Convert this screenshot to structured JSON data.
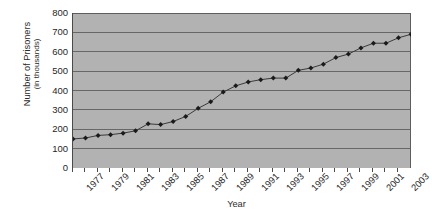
{
  "chart_data": {
    "type": "line",
    "title": "",
    "xlabel": "Year",
    "ylabel": "Number of Prisoners (in thousands)",
    "ylabel_line1": "Number of Prisoners",
    "ylabel_line2": "(in thousands)",
    "ylim": [
      0,
      800
    ],
    "ytick_step": 100,
    "yticks": [
      800,
      700,
      600,
      500,
      400,
      300,
      200,
      100,
      0
    ],
    "ytick_labels": [
      "800",
      "700",
      "600",
      "500",
      "400",
      "300",
      "200",
      "100",
      "0"
    ],
    "grid": "horizontal",
    "legend": "none",
    "marker": "diamond",
    "marker_color": "#1a1a1a",
    "line_color": "#3a3a3a",
    "plot_background": "#b2b2b2",
    "gridline_color": "#5e5e5e",
    "page_background": "#ffffff",
    "xlim": [
      1977,
      2004
    ],
    "xtick_labels": [
      "1977",
      "1979",
      "1981",
      "1983",
      "1985",
      "1987",
      "1989",
      "1991",
      "1993",
      "1995",
      "1997",
      "1999",
      "2001",
      "2003"
    ],
    "x": [
      1977,
      1978,
      1979,
      1980,
      1981,
      1982,
      1983,
      1984,
      1985,
      1986,
      1987,
      1988,
      1989,
      1990,
      1991,
      1992,
      1993,
      1994,
      1995,
      1996,
      1997,
      1998,
      1999,
      2000,
      2001,
      2002,
      2003,
      2004
    ],
    "values": [
      150,
      155,
      168,
      172,
      180,
      192,
      228,
      224,
      240,
      266,
      308,
      342,
      392,
      424,
      444,
      456,
      464,
      464,
      504,
      516,
      536,
      570,
      588,
      620,
      644,
      644,
      672,
      690
    ]
  },
  "axes": {
    "x_title": "Year",
    "y_title_line1": "Number of Prisoners",
    "y_title_line2": "(in thousands)"
  }
}
